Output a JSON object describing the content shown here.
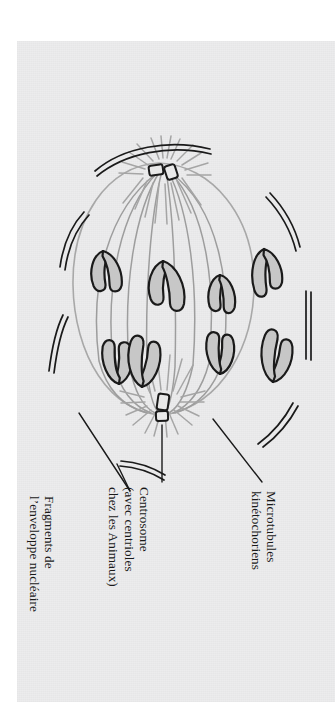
{
  "figure": {
    "orientation": "labels rotated 90 degrees counter-clockwise",
    "colors": {
      "paper": "#ececed",
      "margin": "#ffffff",
      "ink_dark": "#1a1a1a",
      "spindle_gray": "#9b9b9b",
      "chromatid_fill": "#c9c9c9",
      "chromatid_outline": "#1a1a1a",
      "cell_outline": "#a0a0a0"
    }
  },
  "labels": [
    {
      "id": "microtubules-kinetochoriens",
      "lines": [
        "Microtubules",
        "kinétochoriens"
      ]
    },
    {
      "id": "centrosome",
      "lines": [
        "Centrosome",
        "(avec centrioles",
        "chez les Animaux)"
      ]
    },
    {
      "id": "fragments-enveloppe-nucleaire",
      "lines": [
        "Fragments de",
        "l’enveloppe nucléaire"
      ]
    }
  ],
  "structures": {
    "chromosome_count": 8,
    "centrosome_count": 2,
    "centrioles_per_centrosome": 2,
    "envelope_fragment_count": 5
  }
}
